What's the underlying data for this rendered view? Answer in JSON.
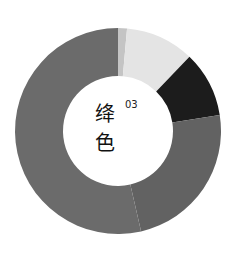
{
  "chart_data": {
    "type": "pie",
    "variant": "donut",
    "title_chars": [
      "绛",
      "色"
    ],
    "title_number": "03",
    "start_angle_deg": 0,
    "direction": "clockwise",
    "center": [
      118,
      131
    ],
    "outer_radius": 103,
    "inner_radius": 55,
    "legend": "none",
    "segments": [
      {
        "name": "segment-1",
        "value": 1.4,
        "color": "#c4c4c4"
      },
      {
        "name": "segment-2",
        "value": 10.8,
        "color": "#e4e4e4"
      },
      {
        "name": "segment-3",
        "value": 10.3,
        "color": "#1c1c1c"
      },
      {
        "name": "segment-4",
        "value": 23.9,
        "color": "#626262"
      },
      {
        "name": "segment-5",
        "value": 53.6,
        "color": "#6b6b6b"
      }
    ]
  },
  "label": {
    "char1": "绛",
    "char2": "色",
    "number": "03"
  }
}
